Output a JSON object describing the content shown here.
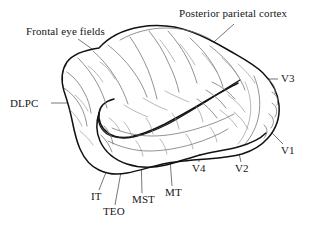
{
  "figure": {
    "background_color": "#ffffff",
    "outline_color": "#111111",
    "sulcus_color": "#6e6e6e",
    "leader_color": "#4a4a4a",
    "text_color": "#161616",
    "width": 311,
    "height": 229
  },
  "labels": {
    "frontal_eye_fields": "Frontal eye fields",
    "posterior_parietal_cortex": "Posterior parietal cortex",
    "dlpc": "DLPC",
    "v3": "V3",
    "v1": "V1",
    "v2": "V2",
    "v4": "V4",
    "mt": "MT",
    "mst": "MST",
    "teo": "TEO",
    "it": "IT"
  },
  "regions": [
    {
      "id": "frontal_eye_fields",
      "label": "Frontal eye fields",
      "side": "top-left"
    },
    {
      "id": "posterior_parietal_cortex",
      "label": "Posterior parietal cortex",
      "side": "top-right"
    },
    {
      "id": "dlpc",
      "label": "DLPC",
      "side": "left"
    },
    {
      "id": "v3",
      "label": "V3",
      "side": "right"
    },
    {
      "id": "v1",
      "label": "V1",
      "side": "right"
    },
    {
      "id": "v2",
      "label": "V2",
      "side": "bottom"
    },
    {
      "id": "v4",
      "label": "V4",
      "side": "bottom"
    },
    {
      "id": "mt",
      "label": "MT",
      "side": "bottom"
    },
    {
      "id": "mst",
      "label": "MST",
      "side": "bottom"
    },
    {
      "id": "teo",
      "label": "TEO",
      "side": "bottom"
    },
    {
      "id": "it",
      "label": "IT",
      "side": "bottom"
    }
  ]
}
